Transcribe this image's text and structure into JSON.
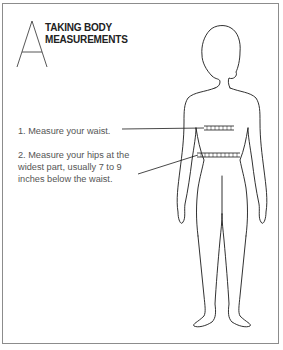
{
  "diagram": {
    "letter": "A",
    "title_line1": "TAKING BODY",
    "title_line2": "MEASUREMENTS",
    "steps": [
      {
        "text": "1. Measure your waist."
      },
      {
        "text_line1": "2. Measure your hips at the",
        "text_line2": "widest part, usually 7 to 9",
        "text_line3": "inches below the waist."
      }
    ],
    "colors": {
      "border": "#8c8c8c",
      "outline": "#1a1a1a",
      "text": "#555555"
    }
  }
}
